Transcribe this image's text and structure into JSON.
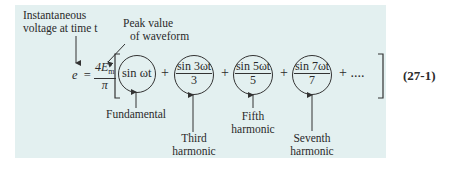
{
  "equation": {
    "lhs": "e",
    "equals": "=",
    "coefficient_numerator": "4E",
    "coefficient_subscript": "m",
    "coefficient_denominator": "π",
    "terms": [
      {
        "id": "fundamental",
        "text": "sin ωt"
      },
      {
        "id": "third",
        "numerator": "sin 3ωt",
        "denominator": "3"
      },
      {
        "id": "fifth",
        "numerator": "sin 5ωt",
        "denominator": "5"
      },
      {
        "id": "seventh",
        "numerator": "sin 7ωt",
        "denominator": "7"
      }
    ],
    "plus": "+",
    "ellipsis": "+ ....",
    "number": "(27-1)"
  },
  "annotations": {
    "instantaneous_line1": "Instantaneous",
    "instantaneous_line2": "voltage at time t",
    "peak_line1": "Peak value",
    "peak_line2": "of waveform",
    "fundamental": "Fundamental",
    "third_line1": "Third",
    "third_line2": "harmonic",
    "fifth_line1": "Fifth",
    "fifth_line2": "harmonic",
    "seventh_line1": "Seventh",
    "seventh_line2": "harmonic"
  },
  "colors": {
    "panel_background": "#e3f0f0",
    "ink": "#2a2a2a"
  }
}
